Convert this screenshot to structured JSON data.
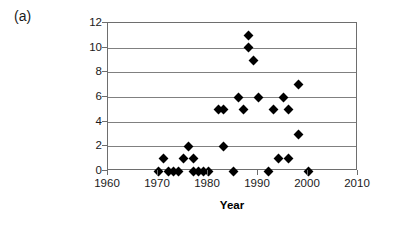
{
  "panel": {
    "label": "(a)"
  },
  "chart_data": {
    "type": "scatter",
    "title": "",
    "subtitle": "",
    "xlabel": "Year",
    "ylabel": "Total number of nests robbed",
    "ylabel_lines": [
      "Total number of nests",
      "robbed"
    ],
    "xlim": [
      1960,
      2010
    ],
    "ylim": [
      0,
      12
    ],
    "xticks": [
      1960,
      1970,
      1980,
      1990,
      2000,
      2010
    ],
    "xtick_labels": [
      "1960",
      "1970",
      "1980",
      "1990",
      "2000",
      "2010"
    ],
    "yticks": [
      0,
      2,
      4,
      6,
      8,
      10,
      12
    ],
    "ytick_labels": [
      "0",
      "2",
      "4",
      "6",
      "8",
      "10",
      "12"
    ],
    "grid": "horizontal",
    "legend": "none",
    "marker": "filled-diamond",
    "marker_color": "#000000",
    "series": [
      {
        "name": "Nests robbed",
        "x": [
          1970,
          1971,
          1972,
          1973,
          1974,
          1975,
          1976,
          1977,
          1977,
          1978,
          1979,
          1980,
          1982,
          1983,
          1983,
          1985,
          1986,
          1987,
          1988,
          1988,
          1989,
          1990,
          1992,
          1993,
          1994,
          1995,
          1996,
          1996,
          1998,
          1998,
          2000
        ],
        "y": [
          0,
          1,
          0,
          0,
          0,
          1,
          2,
          1,
          0,
          0,
          0,
          0,
          5,
          5,
          2,
          0,
          6,
          5,
          10,
          11,
          9,
          6,
          0,
          5,
          1,
          6,
          5,
          1,
          7,
          3,
          0
        ]
      }
    ]
  },
  "colors": {
    "axis": "#6e6e6e",
    "grid": "#808080",
    "marker": "#000000",
    "text": "#1a1a1a",
    "background": "#ffffff"
  }
}
